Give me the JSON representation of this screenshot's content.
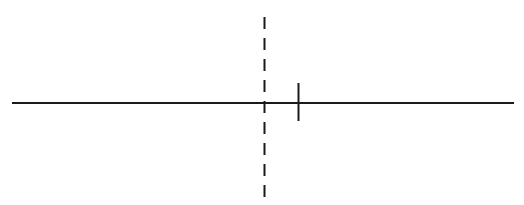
{
  "figure": {
    "title": "Number line with dashed vertical reference and solid tick mark",
    "background_color": "#ffffff",
    "width": 524,
    "height": 205
  },
  "chart_data": {
    "type": "line",
    "title": "Number line with dashed vertical reference and solid tick mark",
    "xlabel": "",
    "ylabel": "",
    "grid": false,
    "legend": null,
    "axis_range_px": [
      12,
      514
    ],
    "elements": [
      {
        "name": "horizontal-axis-line",
        "kind": "solid-horizontal-line",
        "x1": 12,
        "y1": 103,
        "x2": 514,
        "y2": 103,
        "stroke": "#1a1a1a",
        "stroke_width": 2,
        "label": ""
      },
      {
        "name": "vertical-dashed-reference-line",
        "kind": "dashed-vertical-line",
        "x1": 264.5,
        "y1": 17,
        "x2": 264.5,
        "y2": 198,
        "stroke": "#1a1a1a",
        "stroke_width": 2,
        "dash_length": 12,
        "gap_length": 9,
        "label": ""
      },
      {
        "name": "tick-mark",
        "kind": "solid-vertical-tick",
        "x1": 298.5,
        "y1": 83,
        "x2": 298.5,
        "y2": 121,
        "stroke": "#1a1a1a",
        "stroke_width": 2,
        "label": ""
      }
    ],
    "annotations": [],
    "values": [],
    "categories": []
  },
  "colors": {
    "stroke": "#1a1a1a",
    "background": "#ffffff"
  }
}
